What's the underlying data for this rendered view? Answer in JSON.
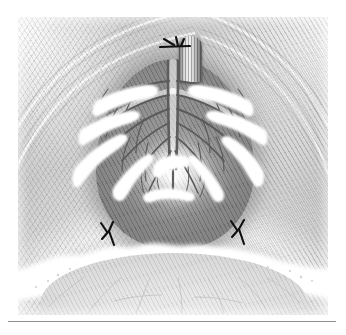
{
  "figure": {
    "domain": "medical-surgical-illustration",
    "title": "",
    "caption": "",
    "style": "grayscale stippled line-and-wash engraving",
    "plate": {
      "x": 18,
      "y": 17,
      "width": 310,
      "height": 298,
      "background_color": "#f2f2f2",
      "border_color": "#ffffff"
    },
    "rule": {
      "x": 8,
      "y": 321,
      "width": 328,
      "height": 1,
      "color": "#8f8f8f"
    }
  },
  "palette": {
    "paper_white": "#ffffff",
    "tissue_light": "#e9e9e9",
    "tissue_mid": "#cfcfcf",
    "mesentery_dark": "#818181",
    "mesentery_darkest": "#767676",
    "vessel_dark": "#5a5a5a",
    "vessel_outline": "#3f3f3f",
    "fat_white": "#ffffff",
    "suture_black": "#101010",
    "rule_gray": "#8f8f8f"
  },
  "structures": {
    "stump": {
      "name": "ligated tubular stump",
      "x": 161,
      "y": 19,
      "width": 23,
      "height": 46,
      "striations": 7
    },
    "mesentery": {
      "name": "mesoappendix / mesentery dome",
      "x": 78,
      "y": 42,
      "width": 158,
      "height": 190,
      "shade": "#818181",
      "central_glow": true
    },
    "bowel_wall": {
      "name": "bowel wall below mesentery",
      "x": 22,
      "y": 236,
      "width": 268,
      "height": 76
    },
    "fat_band": {
      "name": "fatty omental band",
      "color": "#ffffff",
      "stipple_count": 26
    }
  },
  "sutures": [
    {
      "name": "stump-tie-suture",
      "x": 172,
      "y": 41,
      "rotation": 0,
      "label": "stump ligature"
    },
    {
      "name": "left-corner-suture",
      "x": 107,
      "y": 231,
      "rotation": -18,
      "label": "left mesenteric ligature"
    },
    {
      "name": "right-corner-suture",
      "x": 238,
      "y": 230,
      "rotation": 14,
      "label": "right mesenteric ligature"
    }
  ],
  "vessels": {
    "trunk": {
      "x1": 172,
      "y1": 60,
      "x2": 172,
      "y2": 176,
      "stroke_width": 3.2
    },
    "branch_count": 26,
    "arcade_count": 6,
    "description": "paired arterial arcade branching from a central trunk with terminal vasa recta"
  },
  "fat_plaques": [
    {
      "side": "left",
      "name": "upper-left-fat-plaque"
    },
    {
      "side": "left",
      "name": "mid-left-fat-plaque"
    },
    {
      "side": "left",
      "name": "lower-left-fat-plaque"
    },
    {
      "side": "right",
      "name": "upper-right-fat-plaque"
    },
    {
      "side": "right",
      "name": "mid-right-fat-plaque"
    },
    {
      "side": "right",
      "name": "lower-right-fat-plaque"
    },
    {
      "side": "center",
      "name": "central-fat-plaque"
    }
  ]
}
